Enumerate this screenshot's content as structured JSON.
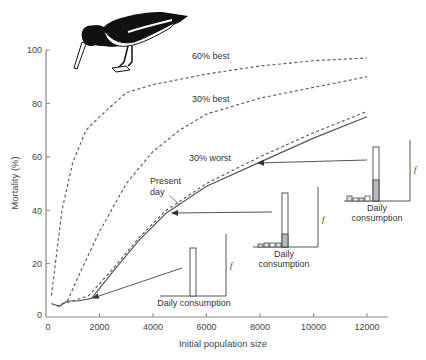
{
  "chart_data": {
    "type": "line",
    "title": "",
    "xlabel": "Initial population size",
    "ylabel": "Mortality (%)",
    "xlim": [
      0,
      12000
    ],
    "ylim": [
      0,
      100
    ],
    "xticks": [
      0,
      2000,
      4000,
      6000,
      8000,
      10000,
      12000
    ],
    "xtick_labels": [
      "0",
      "2000",
      "4000",
      "6000",
      "8000",
      "10000",
      "12000"
    ],
    "yticks": [
      0,
      20,
      40,
      60,
      80,
      100
    ],
    "ytick_labels": [
      "0",
      "20",
      "40",
      "60",
      "80",
      "100"
    ],
    "grid": false,
    "legend": "none (curves labelled inline)",
    "series": [
      {
        "name": "60% best",
        "style": "dashed",
        "label": "60% best",
        "points": [
          [
            200,
            8
          ],
          [
            600,
            40
          ],
          [
            1000,
            58
          ],
          [
            1500,
            70
          ],
          [
            2000,
            75
          ],
          [
            3000,
            84
          ],
          [
            4000,
            87
          ],
          [
            6000,
            91
          ],
          [
            8000,
            94
          ],
          [
            10000,
            96
          ],
          [
            12000,
            97
          ]
        ]
      },
      {
        "name": "30% best",
        "style": "dashed",
        "label": "30% best",
        "points": [
          [
            800,
            6
          ],
          [
            1200,
            15
          ],
          [
            2000,
            32
          ],
          [
            3000,
            50
          ],
          [
            4000,
            62
          ],
          [
            5000,
            70
          ],
          [
            6000,
            76
          ],
          [
            8000,
            82
          ],
          [
            10000,
            86
          ],
          [
            12000,
            90
          ]
        ]
      },
      {
        "name": "30% worst",
        "style": "dashed",
        "label": "30% worst",
        "points": [
          [
            400,
            4
          ],
          [
            600,
            5
          ],
          [
            1000,
            6
          ],
          [
            1600,
            8
          ],
          [
            2500,
            18
          ],
          [
            3500,
            30
          ],
          [
            4500,
            40
          ],
          [
            6000,
            50
          ],
          [
            8000,
            60
          ],
          [
            10000,
            69
          ],
          [
            12000,
            77
          ]
        ]
      },
      {
        "name": "Present day",
        "style": "solid",
        "label": "Present day",
        "points": [
          [
            200,
            5
          ],
          [
            500,
            4
          ],
          [
            800,
            6
          ],
          [
            1200,
            6
          ],
          [
            1700,
            7
          ],
          [
            2500,
            17
          ],
          [
            3500,
            29
          ],
          [
            4500,
            39
          ],
          [
            6000,
            49
          ],
          [
            8000,
            58
          ],
          [
            10000,
            67
          ],
          [
            12000,
            75
          ]
        ]
      }
    ],
    "annotations": [
      {
        "text": "60% best",
        "x": 2300,
        "y": 89
      },
      {
        "text": "30% best",
        "x": 2300,
        "y": 74
      },
      {
        "text": "30% worst",
        "x": 3100,
        "y": 55
      },
      {
        "text": "Present day",
        "x": 2900,
        "y": 47,
        "arrow_to": [
          4300,
          45
        ]
      }
    ],
    "insets": [
      {
        "name": "inset-low-density",
        "xlabel": "Daily consumption",
        "ylabel": "f",
        "arrow_to_point": [
          1700,
          7
        ],
        "bars": [
          {
            "height": 1.0,
            "shaded_fraction": 0
          }
        ]
      },
      {
        "name": "inset-mid-density",
        "xlabel": "Daily consumption",
        "ylabel": "f",
        "arrow_to_point": [
          4500,
          39
        ],
        "bars": [
          {
            "height": 0.05
          },
          {
            "height": 0.09
          },
          {
            "height": 0.09
          },
          {
            "height": 0.09
          },
          {
            "height": 1.0,
            "shaded_fraction": 0.25
          }
        ]
      },
      {
        "name": "inset-high-density",
        "xlabel": "Daily consumption",
        "ylabel": "f",
        "arrow_to_point": [
          7900,
          58
        ],
        "bars": [
          {
            "height": 0.08
          },
          {
            "height": 0.05
          },
          {
            "height": 0.05
          },
          {
            "height": 0.08
          },
          {
            "height": 1.0,
            "shaded_fraction": 0.38
          }
        ]
      }
    ]
  },
  "labels": {
    "curve_60_best": "60% best",
    "curve_30_best": "30% best",
    "curve_30_worst": "30% worst",
    "present_day_line1": "Present",
    "present_day_line2": "day",
    "x_axis_title": "Initial population size",
    "y_axis_title": "Mortality (%)",
    "inset1_xlabel": "Daily consumption",
    "inset2_xlabel_line1": "Daily",
    "inset2_xlabel_line2": "consumption",
    "inset3_xlabel_line1": "Daily",
    "inset3_xlabel_line2": "consumption",
    "f_symbol": "f"
  },
  "colors": {
    "line": "#555555",
    "axis": "#888888",
    "bar_shade": "#b8b8b8",
    "bird_dark": "#111111"
  }
}
